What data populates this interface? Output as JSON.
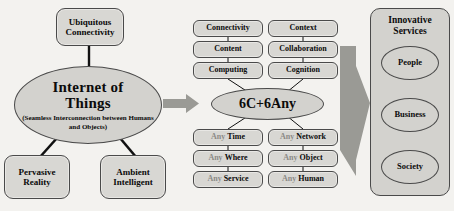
{
  "diagram": {
    "colors": {
      "box_fill": "#d8d7d3",
      "ellipse_fill": "#d3d2ce",
      "stroke": "#4a4a4a",
      "arrow_fill": "#9a9a95",
      "text": "#0b0b0b",
      "muted_text": "#8b8a86",
      "background": "#f3f2ef"
    }
  },
  "left": {
    "top_box": {
      "label": "Ubiquitous\nConnectivity",
      "line1": "Ubiquitous",
      "line2": "Connectivity"
    },
    "center_ellipse": {
      "title_line1": "Internet of",
      "title_line2": "Things",
      "subtitle": "(Seamless Interconnection between Humans and Objects)"
    },
    "bottom_left_box": {
      "line1": "Pervasive",
      "line2": "Reality"
    },
    "bottom_right_box": {
      "line1": "Ambient",
      "line2": "Intelligent"
    }
  },
  "middle": {
    "core_label": "6C+6Any",
    "six_c": [
      {
        "label": "Connectivity"
      },
      {
        "label": "Context"
      },
      {
        "label": "Content"
      },
      {
        "label": "Collaboration"
      },
      {
        "label": "Computing"
      },
      {
        "label": "Cognition"
      }
    ],
    "six_any": [
      {
        "prefix": "Any",
        "word": "Time"
      },
      {
        "prefix": "Any",
        "word": "Network"
      },
      {
        "prefix": "Any",
        "word": "Where"
      },
      {
        "prefix": "Any",
        "word": "Object"
      },
      {
        "prefix": "Any",
        "word": "Service"
      },
      {
        "prefix": "Any",
        "word": "Human"
      }
    ]
  },
  "right": {
    "panel_title_line1": "Innovative",
    "panel_title_line2": "Services",
    "items": [
      {
        "label": "People"
      },
      {
        "label": "Business"
      },
      {
        "label": "Society"
      }
    ]
  },
  "arrows": {
    "left_arrow": "arrow-right-small",
    "right_arrow": "arrow-right-large"
  }
}
